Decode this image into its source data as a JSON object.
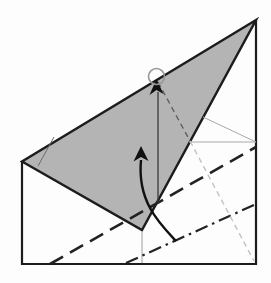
{
  "diagram": {
    "type": "origami-fold-step",
    "canvas": {
      "width": 271,
      "height": 283,
      "background": "#fdfdfd"
    },
    "colors": {
      "outline": "#1c1c1c",
      "flap_fill": "#b4b4b4",
      "bold_fold_line": "#222222",
      "thin_crease": "#a8a8a8",
      "xray_on_flap": "#606060",
      "xray_off_flap": "#c2c2c2",
      "arrow": "#111111",
      "target_circle": "#969696"
    },
    "shapes": [
      {
        "name": "paper-outline",
        "kind": "polyline",
        "points": "22,161.5 22,264 256,264 256,20",
        "stroke": "#1c1c1c",
        "width": 2.2,
        "fill": "none"
      },
      {
        "name": "flap-triangle",
        "kind": "polygon",
        "points": "256,20 22,161.5 142,230",
        "stroke": "#1c1c1c",
        "width": 2.4,
        "fill": "#b4b4b4"
      },
      {
        "name": "flap-corner-crease",
        "kind": "line",
        "x1": 54,
        "y1": 137,
        "x2": 38,
        "y2": 166,
        "stroke": "#6b6b6b",
        "width": 1,
        "fill": "none"
      },
      {
        "name": "vertical-center-crease",
        "kind": "line",
        "x1": 142,
        "y1": 231,
        "x2": 142,
        "y2": 263,
        "stroke": "#9e9e9e",
        "width": 1,
        "fill": "none"
      },
      {
        "name": "horizontal-mid-crease",
        "kind": "line",
        "x1": 189,
        "y1": 142,
        "x2": 256,
        "y2": 142,
        "stroke": "#a8a8a8",
        "width": 1,
        "fill": "none"
      },
      {
        "name": "diagonal-crease",
        "kind": "line",
        "x1": 203,
        "y1": 117,
        "x2": 256,
        "y2": 142,
        "stroke": "#a8a8a8",
        "width": 1,
        "fill": "none"
      },
      {
        "name": "valley-fold-dashed-line",
        "kind": "line",
        "x1": 50,
        "y1": 264,
        "x2": 256,
        "y2": 147,
        "stroke": "#222222",
        "width": 2.6,
        "dash": "15 8",
        "fill": "none"
      },
      {
        "name": "mountain-fold-dashdot-line",
        "kind": "line",
        "x1": 126,
        "y1": 263,
        "x2": 256,
        "y2": 204,
        "stroke": "#222222",
        "width": 2.2,
        "dash": "13 5 2.5 5",
        "fill": "none"
      },
      {
        "name": "xray-dashed-line-on-flap",
        "kind": "line",
        "x1": 158,
        "y1": 82,
        "x2": 190,
        "y2": 141,
        "stroke": "#606060",
        "width": 1.4,
        "dash": "5.5 4",
        "fill": "none"
      },
      {
        "name": "xray-dashed-line-off-flap",
        "kind": "line",
        "x1": 190,
        "y1": 141,
        "x2": 254,
        "y2": 261,
        "stroke": "#c2c2c2",
        "width": 1.4,
        "dash": "5.5 4",
        "fill": "none"
      },
      {
        "name": "straight-arrow-shaft",
        "kind": "line",
        "x1": 158,
        "y1": 203,
        "x2": 158,
        "y2": 92,
        "stroke": "#3a3a3a",
        "width": 1.3,
        "fill": "none"
      },
      {
        "name": "straight-arrow-head",
        "kind": "path",
        "d": "M156.5,79 L163.5,94 L156.5,90 L149.5,95 Z",
        "stroke": "none",
        "width": 0,
        "fill": "#111111"
      },
      {
        "name": "target-circle",
        "kind": "circle",
        "cx": 156.5,
        "cy": 76.5,
        "r": 8,
        "stroke": "#969696",
        "width": 1.6,
        "fill": "none"
      },
      {
        "name": "curved-fold-arrow",
        "kind": "path",
        "d": "M176,241 C160,224 137,202 141,160",
        "stroke": "#111111",
        "width": 2.4,
        "fill": "none"
      },
      {
        "name": "curved-fold-arrow-head",
        "kind": "path",
        "d": "M141,146 L148.5,161 L141,157 L133.5,161.5 Z",
        "stroke": "none",
        "width": 0,
        "fill": "#111111"
      }
    ]
  }
}
